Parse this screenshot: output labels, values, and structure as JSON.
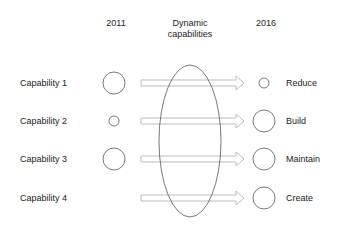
{
  "headers": {
    "left_year": "2011",
    "middle": [
      "Dynamic",
      "capabilities"
    ],
    "right_year": "2016"
  },
  "rows": [
    {
      "label": "Capability 1",
      "circle_2011": "large",
      "outcome": "Reduce",
      "circle_2016": "small"
    },
    {
      "label": "Capability 2",
      "circle_2011": "small",
      "outcome": "Build",
      "circle_2016": "large"
    },
    {
      "label": "Capability 3",
      "circle_2011": "large",
      "outcome": "Maintain",
      "circle_2016": "large"
    },
    {
      "label": "Capability 4",
      "circle_2011": "none",
      "outcome": "Create",
      "circle_2016": "large"
    }
  ],
  "colors": {
    "stroke": "#555555",
    "arrow": "#bbbbbb",
    "text": "#222222"
  }
}
